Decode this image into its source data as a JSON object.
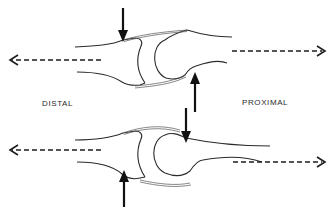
{
  "labels": {
    "left": "DISTAL",
    "right": "PROXIMAL"
  },
  "figures": [
    {
      "id": "top-joint",
      "traction_arrows": [
        "left",
        "right"
      ],
      "compression_arrows": [
        {
          "position": "distal-dorsal",
          "direction": "down"
        },
        {
          "position": "proximal-palmar",
          "direction": "up"
        }
      ]
    },
    {
      "id": "bottom-joint",
      "traction_arrows": [
        "left",
        "right"
      ],
      "compression_arrows": [
        {
          "position": "proximal-dorsal",
          "direction": "down"
        },
        {
          "position": "distal-palmar",
          "direction": "up"
        }
      ]
    }
  ],
  "colors": {
    "line": "#2b2b2b",
    "background": "#ffffff"
  }
}
